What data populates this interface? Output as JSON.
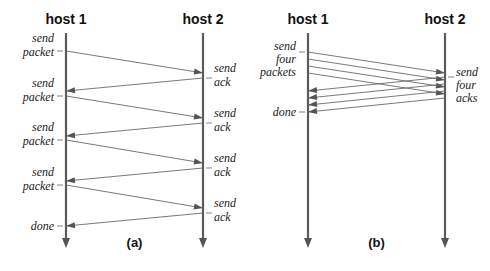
{
  "colors": {
    "timeline": "#5a5a5a",
    "message": "#6a6a6a",
    "text": "#111111",
    "background": "#ffffff"
  },
  "diagrams": [
    {
      "id": "a",
      "caption": "(a)",
      "hosts": [
        {
          "label": "host 1",
          "x": 66
        },
        {
          "label": "host 2",
          "x": 203
        }
      ],
      "host1_labels": [
        {
          "lines": [
            "send",
            "packet"
          ],
          "y": 51
        },
        {
          "lines": [
            "send",
            "packet"
          ],
          "y": 96
        },
        {
          "lines": [
            "send",
            "packet"
          ],
          "y": 140
        },
        {
          "lines": [
            "send",
            "packet"
          ],
          "y": 185
        },
        {
          "lines": [
            "done"
          ],
          "y": 226
        }
      ],
      "host2_labels": [
        {
          "lines": [
            "send",
            "ack"
          ],
          "y": 78
        },
        {
          "lines": [
            "send",
            "ack"
          ],
          "y": 123
        },
        {
          "lines": [
            "send",
            "ack"
          ],
          "y": 168
        },
        {
          "lines": [
            "send",
            "ack"
          ],
          "y": 213
        }
      ],
      "messages": [
        {
          "dir": "right",
          "y1": 51,
          "y2": 73
        },
        {
          "dir": "left",
          "y1": 78,
          "y2": 91
        },
        {
          "dir": "right",
          "y1": 96,
          "y2": 118
        },
        {
          "dir": "left",
          "y1": 123,
          "y2": 136
        },
        {
          "dir": "right",
          "y1": 140,
          "y2": 163
        },
        {
          "dir": "left",
          "y1": 168,
          "y2": 181
        },
        {
          "dir": "right",
          "y1": 185,
          "y2": 208
        },
        {
          "dir": "left",
          "y1": 213,
          "y2": 226
        }
      ]
    },
    {
      "id": "b",
      "caption": "(b)",
      "hosts": [
        {
          "label": "host 1",
          "x": 308
        },
        {
          "label": "host 2",
          "x": 445
        }
      ],
      "host1_labels": [
        {
          "lines": [
            "send",
            "four",
            "packets"
          ],
          "y": 52
        },
        {
          "lines": [
            "done"
          ],
          "y": 112
        }
      ],
      "host2_labels": [
        {
          "lines": [
            "send",
            "four",
            "acks"
          ],
          "y": 77
        }
      ],
      "messages": [
        {
          "dir": "right",
          "y1": 52,
          "y2": 73
        },
        {
          "dir": "right",
          "y1": 59,
          "y2": 80
        },
        {
          "dir": "right",
          "y1": 66,
          "y2": 87
        },
        {
          "dir": "right",
          "y1": 73,
          "y2": 94
        },
        {
          "dir": "left",
          "y1": 77,
          "y2": 91
        },
        {
          "dir": "left",
          "y1": 84,
          "y2": 98
        },
        {
          "dir": "left",
          "y1": 91,
          "y2": 105
        },
        {
          "dir": "left",
          "y1": 98,
          "y2": 112
        }
      ]
    }
  ],
  "layout": {
    "timeline_top": 33,
    "timeline_bottom": 248,
    "header_y": 24,
    "caption_y": 247
  }
}
